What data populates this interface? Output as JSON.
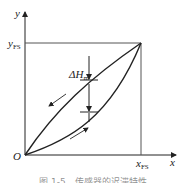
{
  "diagram": {
    "axes": {
      "x_label": "x",
      "y_label": "y",
      "origin_label": "O",
      "x_fs_label": "x",
      "x_fs_sub": "FS",
      "y_fs_label": "y",
      "y_fs_sub": "FS"
    },
    "annotation": {
      "delta_label": "ΔH",
      "delta_sub": "m"
    },
    "caption": "图 1-5　传感器的迟滞特性",
    "colors": {
      "line": "#222222",
      "frame": "#555555",
      "background": "#ffffff"
    }
  }
}
